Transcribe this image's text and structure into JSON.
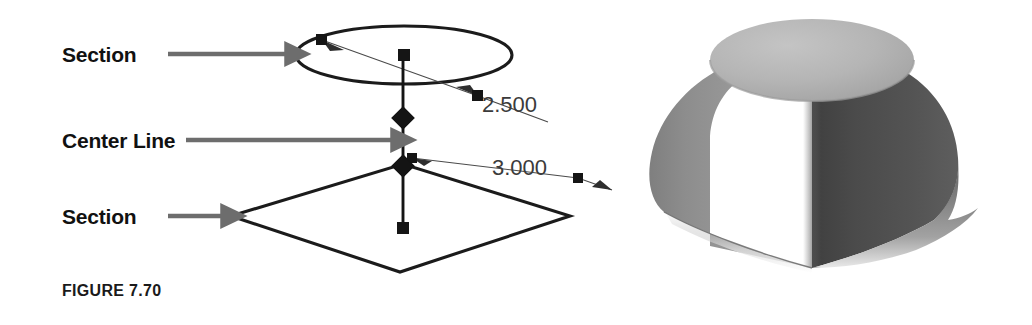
{
  "figure": {
    "caption": "FIGURE 7.70",
    "caption_position": {
      "x": 62,
      "y": 296
    }
  },
  "callouts": [
    {
      "id": "section-top",
      "label": "Section",
      "label_x": 62,
      "label_y": 62,
      "arrow": {
        "x1": 168,
        "y1": 54,
        "x2": 292,
        "y2": 54
      },
      "points_to": "circular-section-ellipse"
    },
    {
      "id": "center-line",
      "label": "Center Line",
      "label_x": 62,
      "label_y": 148,
      "arrow": {
        "x1": 186,
        "y1": 140,
        "x2": 398,
        "y2": 140
      },
      "points_to": "vertical-center-line"
    },
    {
      "id": "section-bottom",
      "label": "Section",
      "label_x": 62,
      "label_y": 224,
      "arrow": {
        "x1": 168,
        "y1": 216,
        "x2": 228,
        "y2": 216
      },
      "points_to": "square-section-profile"
    }
  ],
  "dimensions": [
    {
      "id": "diameter-2500",
      "value": "2.500",
      "text_x": 482,
      "text_y": 112,
      "applies_to": "circular-section-ellipse",
      "leader": [
        {
          "x": 322,
          "y": 40
        },
        {
          "x": 478,
          "y": 96
        },
        {
          "x": 548,
          "y": 122
        }
      ]
    },
    {
      "id": "edge-3000",
      "value": "3.000",
      "text_x": 492,
      "text_y": 175,
      "applies_to": "square-section-profile",
      "leader": [
        {
          "x": 612,
          "y": 190
        },
        {
          "x": 578,
          "y": 178
        },
        {
          "x": 412,
          "y": 158
        }
      ]
    }
  ],
  "geometry": {
    "circular_section": {
      "name": "circular-section-ellipse",
      "center_x": 404,
      "center_y": 55,
      "radius_x": 108,
      "radius_y": 29
    },
    "square_section": {
      "name": "square-section-profile",
      "vertices": [
        {
          "x": 231,
          "y": 216
        },
        {
          "x": 403,
          "y": 164
        },
        {
          "x": 570,
          "y": 216
        },
        {
          "x": 400,
          "y": 272
        }
      ]
    },
    "center_line": {
      "name": "vertical-center-line",
      "x": 403,
      "y_top": 55,
      "y_bottom": 231
    },
    "grips": [
      {
        "type": "square",
        "x": 322,
        "y": 40
      },
      {
        "type": "square",
        "x": 404,
        "y": 55
      },
      {
        "type": "square",
        "x": 478,
        "y": 96
      },
      {
        "type": "diamond",
        "x": 403,
        "y": 118
      },
      {
        "type": "diamond",
        "x": 403,
        "y": 166
      },
      {
        "type": "square",
        "x": 403,
        "y": 228
      },
      {
        "type": "square",
        "x": 412,
        "y": 158
      },
      {
        "type": "square",
        "x": 578,
        "y": 178
      }
    ]
  },
  "solid_model": {
    "name": "lofted-solid-square-to-circle",
    "description": "Shaded 3D lofted solid transitioning from a square base to a circular top",
    "bounds": {
      "x": 612,
      "y": 18,
      "width": 420,
      "height": 260
    },
    "top_face_center": {
      "x": 812,
      "y": 60
    },
    "base_front_corner": {
      "x": 812,
      "y": 268
    }
  },
  "colors": {
    "ink": "#1b1b1b",
    "thin_ink": "#4a4a4a",
    "callout_gray": "#6d6d6d",
    "dim_text": "#3b3b3b",
    "caption": "#1a1a1a",
    "solid_top_face": "#b6b6b6",
    "solid_left_face": "#8e8e8e",
    "solid_right_face": "#4c4c4c",
    "background": "#ffffff"
  }
}
